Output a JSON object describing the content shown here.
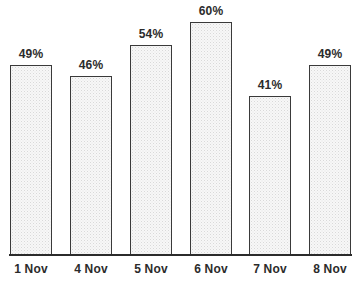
{
  "chart_data": {
    "type": "bar",
    "title": "",
    "subtitle": "",
    "xlabel": "",
    "ylabel": "",
    "ylim": [
      0,
      65
    ],
    "grid": false,
    "legend": false,
    "value_suffix": "%",
    "categories": [
      "1 Nov",
      "4 Nov",
      "5 Nov",
      "6 Nov",
      "7 Nov",
      "8 Nov"
    ],
    "values": [
      49,
      46,
      54,
      60,
      41,
      49
    ],
    "data_labels": [
      "49%",
      "46%",
      "54%",
      "60%",
      "41%",
      "49%"
    ],
    "colors": {
      "bar_fill": "#f7f7f7",
      "bar_border": "#3a3a3a",
      "axis": "#2b2b2b",
      "text": "#2b2b2b",
      "background": "#ffffff"
    }
  }
}
